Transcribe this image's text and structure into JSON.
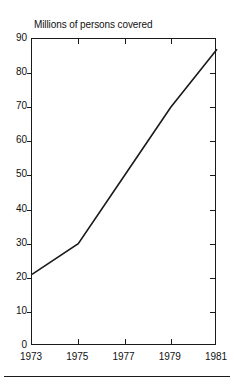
{
  "chart_data": {
    "type": "line",
    "title": "Millions of persons covered",
    "xlabel": "",
    "ylabel": "",
    "x": [
      1973,
      1975,
      1977,
      1979,
      1981
    ],
    "values": [
      21,
      30,
      50,
      70,
      87
    ],
    "series": [
      {
        "name": "Millions of persons covered",
        "x": [
          1973,
          1975,
          1977,
          1979,
          1981
        ],
        "values": [
          21,
          30,
          50,
          70,
          87
        ]
      }
    ],
    "xlim": [
      1973,
      1981
    ],
    "ylim": [
      0,
      90
    ],
    "xticks": [
      1973,
      1975,
      1977,
      1979,
      1981
    ],
    "xtick_labels": [
      "1973",
      "1975",
      "1977",
      "1979",
      "1981"
    ],
    "yticks": [
      0,
      10,
      20,
      30,
      40,
      50,
      60,
      70,
      80,
      90
    ],
    "ytick_labels": [
      "0",
      "10",
      "20",
      "30",
      "40",
      "50",
      "60",
      "70",
      "80",
      "90"
    ],
    "grid": false,
    "legend": false,
    "legend_position": "none",
    "line_color": "#1a1a1a",
    "frame_color": "#1a1a1a",
    "background_color": "#ffffff"
  }
}
